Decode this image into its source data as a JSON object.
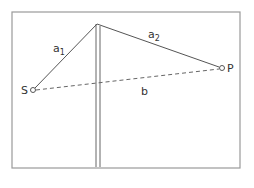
{
  "diagram": {
    "title": "",
    "frame": {
      "x": 12,
      "y": 12,
      "width": 228,
      "height": 156,
      "stroke": "#9a9a9a"
    },
    "apex": {
      "x": 97,
      "y": 24
    },
    "mast": {
      "x_left": 96,
      "x_right": 100,
      "top": 24,
      "bottom": 167
    },
    "points": {
      "S": {
        "label": "S",
        "x": 33,
        "y": 90
      },
      "P": {
        "label": "P",
        "x": 222,
        "y": 68
      }
    },
    "segments": [
      {
        "name": "a1",
        "label": "a",
        "subscript": "1",
        "from": "S",
        "to": "apex",
        "style": "solid"
      },
      {
        "name": "a2",
        "label": "a",
        "subscript": "2",
        "from": "apex",
        "to": "P",
        "style": "solid"
      },
      {
        "name": "b",
        "label": "b",
        "from": "S",
        "to": "P",
        "style": "dashed"
      }
    ],
    "line_color": "#555555"
  }
}
